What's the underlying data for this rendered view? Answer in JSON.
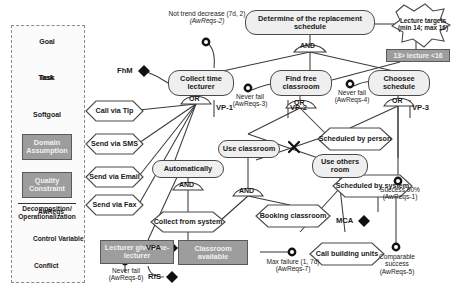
{
  "diagram": {
    "type": "goal-model"
  },
  "legend": {
    "title": "",
    "shapes": [
      {
        "key": "goal",
        "label": "Goal"
      },
      {
        "key": "task",
        "label": "Task"
      },
      {
        "key": "softgoal",
        "label": "Softgoal"
      },
      {
        "key": "domain",
        "label": "Domain Assumption"
      },
      {
        "key": "quality",
        "label": "Quality Constraint"
      }
    ],
    "relation_label": "Decomposition/ Operationalization",
    "markers": [
      {
        "key": "awreqs-marker",
        "glyph": "donut",
        "label": "AwReqs"
      },
      {
        "key": "control-marker",
        "glyph": "diamond",
        "label": "Control Variable"
      },
      {
        "key": "conflict-marker",
        "glyph": "x",
        "label": "Conflict"
      }
    ]
  },
  "nodes": {
    "root": {
      "label": "Determine of the replacement schedule",
      "kind": "goal"
    },
    "collect_time_lecturer": {
      "label": "Collect time lecturer",
      "kind": "goal"
    },
    "find_free_classroom": {
      "label": "Find free classroom",
      "kind": "goal"
    },
    "choosee_schedule": {
      "label": "Choosee schedule",
      "kind": "goal"
    },
    "automatically": {
      "label": "Automatically",
      "kind": "goal"
    },
    "use_classroom": {
      "label": "Use classroom",
      "kind": "goal"
    },
    "use_others_room": {
      "label": "Use others room",
      "kind": "goal"
    },
    "call_via_tlp": {
      "label": "Call via Tlp",
      "kind": "task"
    },
    "send_via_sms": {
      "label": "Send via SMS",
      "kind": "task"
    },
    "send_via_email": {
      "label": "Send via Email",
      "kind": "task"
    },
    "send_via_fax": {
      "label": "Send via Fax",
      "kind": "task"
    },
    "collect_from_system": {
      "label": "Collect from system",
      "kind": "task"
    },
    "booking_classroom": {
      "label": "Booking classroom",
      "kind": "task"
    },
    "call_building_units": {
      "label": "Call building units",
      "kind": "task"
    },
    "scheduled_by_person": {
      "label": "Scheduled by person",
      "kind": "task"
    },
    "scheduled_by_system": {
      "label": "Scheduled by system",
      "kind": "task"
    },
    "lecturer_give_time": {
      "label": "Lecturer give time-lecturer",
      "kind": "domain"
    },
    "classroom_available": {
      "label": "Classroom available",
      "kind": "domain"
    },
    "lecture_targets": {
      "label": "Lecture targets (min 14; max 16)",
      "kind": "softgoal"
    },
    "lecture_qc": {
      "label": "13> lecture <16",
      "kind": "quality"
    }
  },
  "awreqs": [
    {
      "id": "AwReqs-2",
      "label": "Not trend decrease (7d, 2)",
      "ref": "(AwReqs-2)"
    },
    {
      "id": "AwReqs-3",
      "label": "Never fail",
      "ref": "(AwReqs-3)"
    },
    {
      "id": "AwReqs-4",
      "label": "Never fail",
      "ref": "(AwReqs-4)"
    },
    {
      "id": "AwReqs-1",
      "label": "Success 90%",
      "ref": "(AwReqs-1)"
    },
    {
      "id": "AwReqs-5",
      "label": "Comparable success",
      "ref": "(AwReqs-5)"
    },
    {
      "id": "AwReqs-6",
      "label": "Never fail",
      "ref": "(AwReqs-6)"
    },
    {
      "id": "AwReqs-7",
      "label": "Max failure (1, 7d)",
      "ref": "(AwReqs-7)"
    }
  ],
  "control_variables": [
    {
      "id": "FhM",
      "label": "FhM"
    },
    {
      "id": "VPA",
      "label": "VPA"
    },
    {
      "id": "RfS",
      "label": "RfS"
    },
    {
      "id": "MCA",
      "label": "MCA"
    }
  ],
  "variation_points": [
    {
      "id": "VP-1",
      "label": "VP-1"
    },
    {
      "id": "VP-2",
      "label": "VP-2"
    },
    {
      "id": "VP-3",
      "label": "VP-3"
    }
  ],
  "connectors": {
    "and": "AND",
    "or": "OR"
  },
  "connector_instances": [
    {
      "key": "and-root",
      "type": "AND"
    },
    {
      "key": "or-collect",
      "type": "OR"
    },
    {
      "key": "or-findfree",
      "type": "OR"
    },
    {
      "key": "or-choosee",
      "type": "OR"
    },
    {
      "key": "and-automatically",
      "type": "AND"
    },
    {
      "key": "and-useclassroom",
      "type": "AND"
    }
  ],
  "colors": {
    "node_fill": "#efefef",
    "node_stroke": "#4a4a4a",
    "domain_fill": "#9d9d9d",
    "domain_text": "#f2f2f2",
    "edge": "#3a3a3a",
    "legend_border": "#8a8a8a",
    "background": "#ffffff"
  }
}
